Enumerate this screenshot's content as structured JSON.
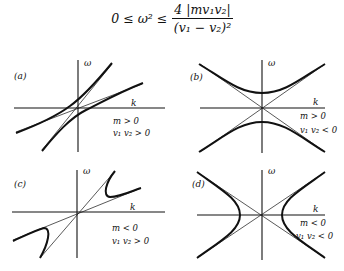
{
  "formula": {
    "lhs": "0 ≤ ω² ≤",
    "numerator": "4 |mv₁v₂|",
    "denominator": "(v₁ − v₂)²"
  },
  "axes": {
    "x_label": "k",
    "y_label": "ω"
  },
  "panels": [
    {
      "id": "a",
      "label": "(a)",
      "cond_m": "m > 0",
      "cond_v": "v₁ v₂ > 0"
    },
    {
      "id": "b",
      "label": "(b)",
      "cond_m": "m > 0",
      "cond_v": "v₁ v₂ < 0"
    },
    {
      "id": "c",
      "label": "(c)",
      "cond_m": "m < 0",
      "cond_v": "v₁ v₂ > 0"
    },
    {
      "id": "d",
      "label": "(d)",
      "cond_m": "m < 0",
      "cond_v": "v₁ v₂ < 0"
    }
  ]
}
